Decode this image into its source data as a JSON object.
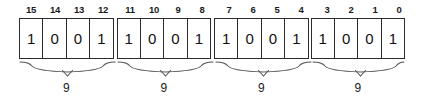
{
  "figure": {
    "colors": {
      "background": "#ffffff",
      "border": "#2b2b2b",
      "text": "#1a1a1a",
      "brace": "#555555"
    }
  },
  "bit_indices": [
    [
      "15",
      "14",
      "13",
      "12"
    ],
    [
      "11",
      "10",
      "9",
      "8"
    ],
    [
      "7",
      "6",
      "5",
      "4"
    ],
    [
      "3",
      "2",
      "1",
      "0"
    ]
  ],
  "bit_values": [
    [
      "1",
      "0",
      "0",
      "1"
    ],
    [
      "1",
      "0",
      "0",
      "1"
    ],
    [
      "1",
      "0",
      "0",
      "1"
    ],
    [
      "1",
      "0",
      "0",
      "1"
    ]
  ],
  "group_labels": [
    "9",
    "9",
    "9",
    "9"
  ]
}
